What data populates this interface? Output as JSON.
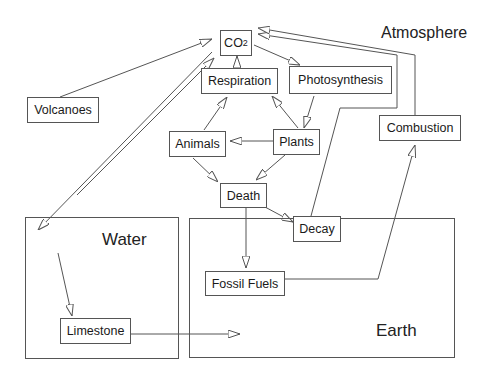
{
  "diagram": {
    "regions": {
      "atmosphere": "Atmosphere",
      "water": "Water",
      "earth": "Earth"
    },
    "nodes": {
      "co2": {
        "main": "CO",
        "sub": "2"
      },
      "respiration": "Respiration",
      "photosynthesis": "Photosynthesis",
      "volcanoes": "Volcanoes",
      "animals": "Animals",
      "plants": "Plants",
      "combustion": "Combustion",
      "death": "Death",
      "decay": "Decay",
      "fossil_fuels": "Fossil Fuels",
      "limestone": "Limestone"
    },
    "edges": [
      {
        "from": "Volcanoes",
        "to": "CO2"
      },
      {
        "from": "Respiration",
        "to": "CO2"
      },
      {
        "from": "CO2",
        "to": "Photosynthesis"
      },
      {
        "from": "Photosynthesis",
        "to": "Plants"
      },
      {
        "from": "Plants",
        "to": "Respiration"
      },
      {
        "from": "Animals",
        "to": "Respiration"
      },
      {
        "from": "Plants",
        "to": "Animals"
      },
      {
        "from": "Plants",
        "to": "Death"
      },
      {
        "from": "Animals",
        "to": "Death"
      },
      {
        "from": "Death",
        "to": "Decay"
      },
      {
        "from": "Death",
        "to": "Fossil Fuels"
      },
      {
        "from": "Decay",
        "to": "CO2"
      },
      {
        "from": "Fossil Fuels",
        "to": "Combustion"
      },
      {
        "from": "Combustion",
        "to": "CO2"
      },
      {
        "from": "CO2",
        "to": "Water",
        "bidirectional": true
      },
      {
        "from": "Water",
        "to": "Limestone"
      },
      {
        "from": "Limestone",
        "to": "Earth"
      }
    ],
    "colors": {
      "line": "#555555",
      "text": "#1a1a1a",
      "background": "#ffffff"
    }
  }
}
